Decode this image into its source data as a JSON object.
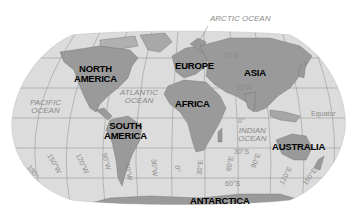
{
  "map": {
    "projection": "Robinson",
    "colors": {
      "ocean": "#dcdcdc",
      "land": "#9a9a9a",
      "land_light": "#b5b5b5",
      "gridline": "#8c8c8c",
      "label_ocean": "#8a8a8a",
      "label_continent": "#000000"
    },
    "continents": [
      {
        "id": "north-america",
        "label": "NORTH\nAMERICA",
        "line1": "NORTH",
        "line2": "AMERICA"
      },
      {
        "id": "south-america",
        "label": "SOUTH\nAMERICA",
        "line1": "SOUTH",
        "line2": "AMERICA"
      },
      {
        "id": "europe",
        "label": "EUROPE"
      },
      {
        "id": "africa",
        "label": "AFRICA"
      },
      {
        "id": "asia",
        "label": "ASIA"
      },
      {
        "id": "australia",
        "label": "AUSTRALIA"
      },
      {
        "id": "antarctica",
        "label": "ANTARCTICA"
      }
    ],
    "oceans": {
      "arctic": "ARCTIC OCEAN",
      "atlantic_l1": "ATLANTIC",
      "atlantic_l2": "OCEAN",
      "pacific_l1": "PACIFIC",
      "pacific_l2": "OCEAN",
      "indian_l1": "INDIAN",
      "indian_l2": "OCEAN"
    },
    "latitudes": {
      "lat60n": "60°N",
      "lat30n": "30°N",
      "equator": "Equator",
      "lat0": "0°",
      "lat30s": "30°S",
      "lat60s": "60°S"
    },
    "longitudes": {
      "lon180": "180°",
      "lon150w": "150°W",
      "lon120w": "120°W",
      "lon90w": "90°W",
      "lon60w": "60°W",
      "lon30w": "30°W",
      "lon0": "0°",
      "lon30e": "30°E",
      "lon60e": "60°E",
      "lon90e": "90°E",
      "lon120e": "120°E",
      "lon150e": "150°E"
    }
  }
}
